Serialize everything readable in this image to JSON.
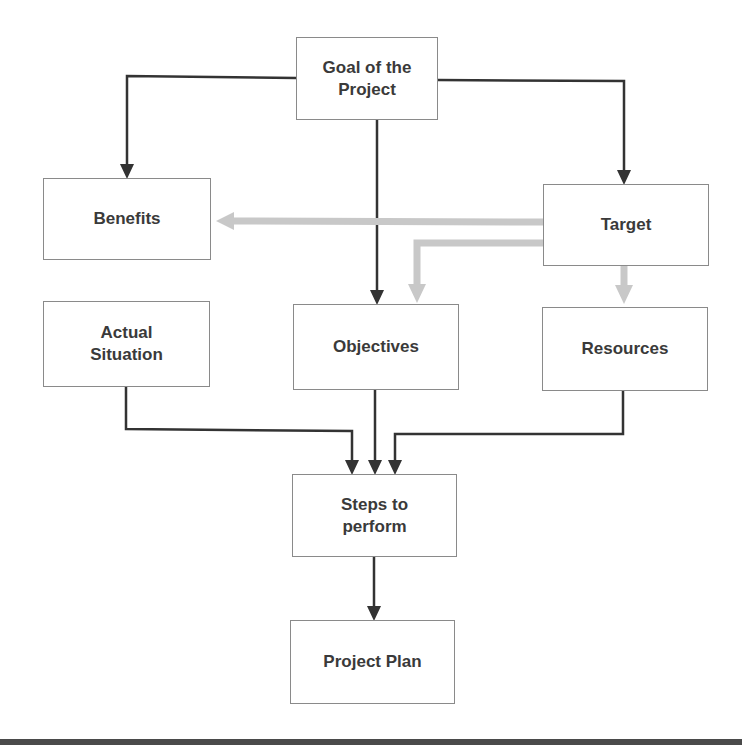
{
  "diagram": {
    "colors": {
      "primary_arrow": "#333333",
      "secondary_arrow": "#c8c8c8",
      "box_border": "#8a8a8a",
      "text": "#3a3a3a",
      "rule": "#4a4a4a"
    },
    "nodes": {
      "goal": {
        "label": "Goal of the\nProject"
      },
      "benefits": {
        "label": "Benefits"
      },
      "target": {
        "label": "Target"
      },
      "actual_situation": {
        "label": "Actual\nSituation"
      },
      "objectives": {
        "label": "Objectives"
      },
      "resources": {
        "label": "Resources"
      },
      "steps": {
        "label": "Steps to\nperform"
      },
      "project_plan": {
        "label": "Project Plan"
      }
    },
    "edges": [
      {
        "from": "Goal of the Project",
        "to": "Benefits",
        "style": "primary"
      },
      {
        "from": "Goal of the Project",
        "to": "Objectives",
        "style": "primary"
      },
      {
        "from": "Goal of the Project",
        "to": "Target",
        "style": "primary"
      },
      {
        "from": "Target",
        "to": "Benefits",
        "style": "secondary"
      },
      {
        "from": "Target",
        "to": "Objectives",
        "style": "secondary"
      },
      {
        "from": "Target",
        "to": "Resources",
        "style": "secondary"
      },
      {
        "from": "Actual Situation",
        "to": "Steps to perform",
        "style": "primary"
      },
      {
        "from": "Objectives",
        "to": "Steps to perform",
        "style": "primary"
      },
      {
        "from": "Resources",
        "to": "Steps to perform",
        "style": "primary"
      },
      {
        "from": "Steps to perform",
        "to": "Project Plan",
        "style": "primary"
      }
    ]
  }
}
